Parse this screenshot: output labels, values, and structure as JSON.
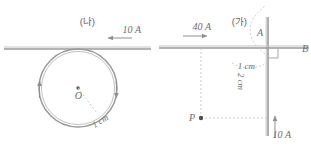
{
  "figure": {
    "kind": "physics-diagram",
    "stroke_color": "#9a9a9a",
    "text_color": "#6d6d6d",
    "dotted_color": "#bdbdbd",
    "background": "#ffffff"
  },
  "panels": [
    {
      "id": "panel-a",
      "caption": "(가)",
      "position": "right",
      "elements": {
        "horizontal_wire_current": "40 A",
        "vertical_wire_current": "10 A",
        "vertical_wire_top_label": "A",
        "horizontal_wire_right_label": "B",
        "distance_top": "1 cm",
        "distance_side": "2 cm",
        "point_label": "P",
        "right_angle_marker": true
      }
    },
    {
      "id": "panel-b",
      "caption": "(나)",
      "position": "left",
      "elements": {
        "straight_wire_current": "10 A",
        "loop_center_label": "O",
        "loop_radius_label": "1 cm",
        "loop_arrow_left": "up",
        "loop_arrow_right": "down"
      }
    }
  ]
}
